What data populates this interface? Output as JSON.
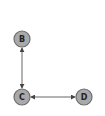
{
  "diagram": {
    "type": "graph",
    "nodes": [
      {
        "id": "B",
        "label": "B",
        "x": 22,
        "y": 39
      },
      {
        "id": "C",
        "label": "C",
        "x": 22,
        "y": 97
      },
      {
        "id": "D",
        "label": "D",
        "x": 84,
        "y": 97
      }
    ],
    "edges": [
      {
        "from": "B",
        "to": "C",
        "direction": "both"
      },
      {
        "from": "C",
        "to": "D",
        "direction": "both"
      }
    ],
    "colors": {
      "node_fill": "#a9a9a9",
      "node_stroke": "#6e6e6e",
      "edge": "#666666"
    }
  }
}
